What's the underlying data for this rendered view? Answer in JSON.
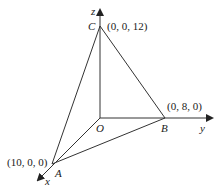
{
  "diagram": {
    "type": "3d-coordinate-tetrahedron",
    "axes": {
      "x": {
        "label": "x"
      },
      "y": {
        "label": "y"
      },
      "z": {
        "label": "z"
      }
    },
    "points": {
      "O": {
        "label": "O",
        "coords": ""
      },
      "A": {
        "label": "A",
        "coords": "(10, 0, 0)"
      },
      "B": {
        "label": "B",
        "coords": "(0, 8, 0)"
      },
      "C": {
        "label": "C",
        "coords": "(0, 0, 12)"
      }
    },
    "edges": [
      "OA",
      "OB",
      "OC",
      "AB",
      "AC",
      "BC"
    ],
    "colors": {
      "line": "#333333",
      "text": "#222222",
      "background": "#ffffff"
    }
  }
}
